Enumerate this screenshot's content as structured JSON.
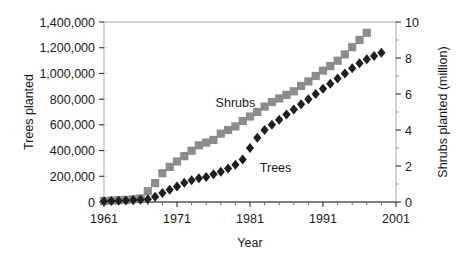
{
  "chart_data": {
    "type": "scatter",
    "title": "",
    "xlabel": "Year",
    "ylabel": "Trees planted",
    "y2label": "Shrubs planted (million)",
    "xlim": [
      1961,
      2001
    ],
    "ylim": [
      0,
      1400000
    ],
    "y2lim": [
      0,
      10
    ],
    "grid": false,
    "legend_position": "inline-annotation",
    "xticks": [
      "1961",
      "1971",
      "1981",
      "1991",
      "2001"
    ],
    "xtick_values": [
      1961,
      1971,
      1981,
      1991,
      2001
    ],
    "yticks": [
      "0",
      "200,000",
      "400,000",
      "600,000",
      "800,000",
      "1,000,000",
      "1,200,000",
      "1,400,000"
    ],
    "ytick_values": [
      0,
      200000,
      400000,
      600000,
      800000,
      1000000,
      1200000,
      1400000
    ],
    "y2ticks": [
      "0",
      "2",
      "4",
      "6",
      "8",
      "10"
    ],
    "y2tick_values": [
      0,
      2,
      4,
      6,
      8,
      10
    ],
    "minor_xtick_values": [
      1963,
      1965,
      1967,
      1969,
      1973,
      1975,
      1977,
      1979,
      1983,
      1985,
      1987,
      1989,
      1993,
      1995,
      1997,
      1999
    ],
    "series": [
      {
        "name": "Shrubs",
        "axis": "right",
        "marker": "square",
        "color": "#8c8c8c",
        "label_x": 1979.0,
        "label_y": 5.3,
        "x": [
          1961,
          1962,
          1963,
          1964,
          1965,
          1966,
          1967,
          1968,
          1969,
          1970,
          1971,
          1972,
          1973,
          1974,
          1975,
          1976,
          1977,
          1978,
          1979,
          1980,
          1981,
          1982,
          1983,
          1984,
          1985,
          1986,
          1987,
          1988,
          1989,
          1990,
          1991,
          1992,
          1993,
          1994,
          1995,
          1996,
          1997
        ],
        "values": [
          0.05,
          0.08,
          0.1,
          0.12,
          0.15,
          0.2,
          0.6,
          1.05,
          1.6,
          1.95,
          2.25,
          2.55,
          2.85,
          3.15,
          3.3,
          3.45,
          3.8,
          4.0,
          4.2,
          4.5,
          4.75,
          5.0,
          5.3,
          5.55,
          5.75,
          5.95,
          6.15,
          6.45,
          6.7,
          7.0,
          7.3,
          7.55,
          7.85,
          8.2,
          8.6,
          9.0,
          9.4
        ]
      },
      {
        "name": "Trees",
        "axis": "left",
        "marker": "diamond",
        "color": "#1f1f1f",
        "label_x": 1984.5,
        "label_y": 230000,
        "x": [
          1961,
          1962,
          1963,
          1964,
          1965,
          1966,
          1967,
          1968,
          1969,
          1970,
          1971,
          1972,
          1973,
          1974,
          1975,
          1976,
          1977,
          1978,
          1979,
          1980,
          1981,
          1982,
          1983,
          1984,
          1985,
          1986,
          1987,
          1988,
          1989,
          1990,
          1991,
          1992,
          1993,
          1994,
          1995,
          1996,
          1997,
          1998,
          1999
        ],
        "values": [
          5000,
          8000,
          10000,
          12000,
          15000,
          18000,
          22000,
          40000,
          70000,
          95000,
          120000,
          150000,
          170000,
          185000,
          195000,
          215000,
          235000,
          260000,
          290000,
          330000,
          420000,
          500000,
          560000,
          600000,
          640000,
          680000,
          720000,
          760000,
          800000,
          840000,
          880000,
          920000,
          960000,
          1000000,
          1040000,
          1080000,
          1110000,
          1135000,
          1160000
        ]
      }
    ]
  },
  "axes": {
    "left_title": "Trees planted",
    "right_title": "Shrubs planted (million)",
    "bottom_title": "Year"
  }
}
